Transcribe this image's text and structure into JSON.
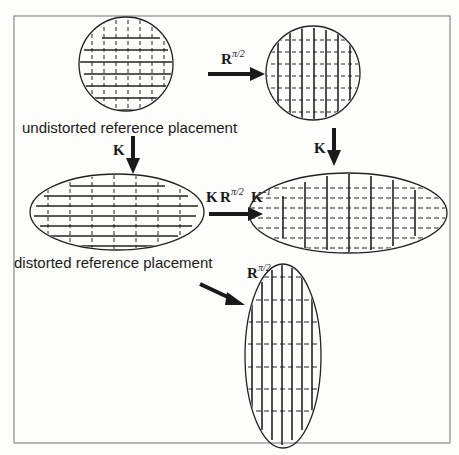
{
  "figure": {
    "frame_color": "#8a8a8a",
    "ink_color": "#1a1a1a",
    "background": "#fdfdfc"
  },
  "captions": {
    "undistorted": "undistorted reference placement",
    "distorted": "distorted reference placement"
  },
  "operators": {
    "rotation_top": {
      "base": "R",
      "exponent": "π/2"
    },
    "k_left": {
      "base": "K"
    },
    "k_right": {
      "base": "K"
    },
    "conjugate": {
      "k1": "K",
      "r": "R",
      "r_exp": "π/2",
      "k2": "K",
      "k2_exp": "-1"
    },
    "rotation_diag": {
      "base": "R",
      "exponent": "π/2"
    }
  },
  "shapes": [
    {
      "id": "undistorted-circle",
      "type": "circle",
      "solid_lines": "horizontal",
      "dashed_lines": "vertical"
    },
    {
      "id": "rotated-circle",
      "type": "circle",
      "solid_lines": "vertical",
      "dashed_lines": "horizontal"
    },
    {
      "id": "distorted-ellipse",
      "type": "ellipse-horizontal",
      "solid_lines": "horizontal",
      "dashed_lines": "vertical"
    },
    {
      "id": "conjugated-ellipse",
      "type": "ellipse-horizontal",
      "solid_lines": "vertical",
      "dashed_lines": "horizontal"
    },
    {
      "id": "rotated-ellipse",
      "type": "ellipse-vertical",
      "solid_lines": "vertical",
      "dashed_lines": "horizontal"
    }
  ]
}
